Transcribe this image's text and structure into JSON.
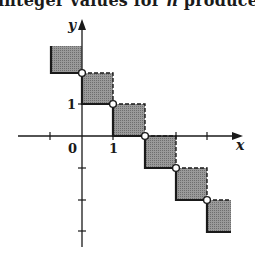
{
  "caption": {
    "before": "integer values for ",
    "variable": "n",
    "after": " produce"
  },
  "figure": {
    "x_axis_label": "x",
    "y_axis_label": "y",
    "origin_label": "0",
    "x_tick_label": "1",
    "y_tick_label": "1",
    "fill_color": "#8c8c8c",
    "stroke_color": "#1a1a1a",
    "x_ticks": [
      -1,
      0,
      1,
      2,
      3,
      4
    ],
    "y_ticks": [
      1,
      0,
      -1,
      -2,
      -3
    ],
    "squares": [
      {
        "x_from": -1,
        "x_to": 0,
        "y_from": 1,
        "y_to": 2,
        "open_corner": false
      },
      {
        "x_from": 0,
        "x_to": 1,
        "y_from": 0,
        "y_to": 1,
        "open_corner": true
      },
      {
        "x_from": 1,
        "x_to": 2,
        "y_from": -1,
        "y_to": 0,
        "open_corner": true
      },
      {
        "x_from": 2,
        "x_to": 3,
        "y_from": -2,
        "y_to": -1,
        "open_corner": true
      },
      {
        "x_from": 3,
        "x_to": 4,
        "y_from": -3,
        "y_to": -2,
        "open_corner": true
      },
      {
        "x_from": 4,
        "x_to": 5,
        "y_from": -4,
        "y_to": -3,
        "open_corner": true
      }
    ]
  }
}
